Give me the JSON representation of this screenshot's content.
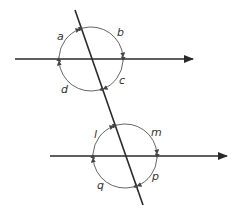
{
  "diagram": {
    "type": "angles-transversal-parallel-lines",
    "colors": {
      "line": "#2a2a2a",
      "arc": "#555555",
      "text": "#333333"
    },
    "upper_intersection": {
      "angles": [
        {
          "id": "a",
          "label": "a"
        },
        {
          "id": "b",
          "label": "b"
        },
        {
          "id": "c",
          "label": "c"
        },
        {
          "id": "d",
          "label": "d"
        }
      ]
    },
    "lower_intersection": {
      "angles": [
        {
          "id": "l",
          "label": "l"
        },
        {
          "id": "m",
          "label": "m"
        },
        {
          "id": "p",
          "label": "p"
        },
        {
          "id": "q",
          "label": "q"
        }
      ]
    }
  }
}
